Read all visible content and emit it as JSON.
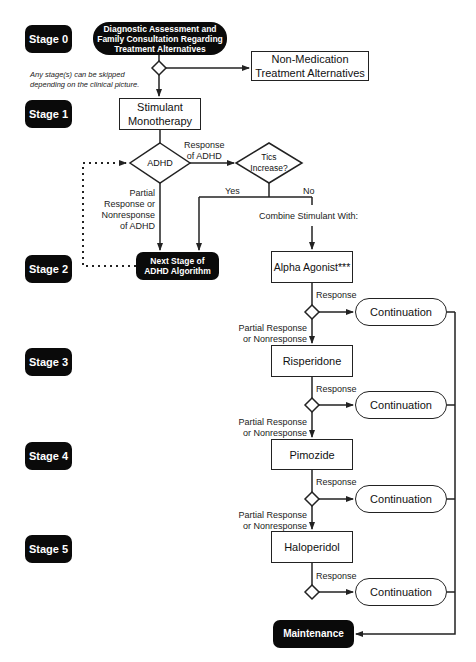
{
  "stages": [
    "Stage 0",
    "Stage 1",
    "Stage 2",
    "Stage 3",
    "Stage 4",
    "Stage 5"
  ],
  "note": {
    "line1": "Any stage(s) can be skipped",
    "line2": "depending on the clinical picture."
  },
  "nodes": {
    "diagnostic": {
      "line1": "Diagnostic Assessment and",
      "line2": "Family Consultation Regarding",
      "line3": "Treatment Alternatives"
    },
    "non_medication": {
      "line1": "Non-Medication",
      "line2": "Treatment Alternatives"
    },
    "stimulant": {
      "line1": "Stimulant",
      "line2": "Monotherapy"
    },
    "adhd_decision": "ADHD",
    "tics_decision": {
      "line1": "Tics",
      "line2": "Increase?"
    },
    "next_stage": {
      "line1": "Next Stage of",
      "line2": "ADHD Algorithm"
    },
    "alpha_agonist": "Alpha Agonist***",
    "risperidone": "Risperidone",
    "pimozide": "Pimozide",
    "haloperidol": "Haloperidol",
    "continuation": "Continuation",
    "maintenance": "Maintenance"
  },
  "edge_labels": {
    "response_of_adhd": {
      "line1": "Response",
      "line2": "of ADHD"
    },
    "partial_adhd": {
      "line1": "Partial",
      "line2": "Response or",
      "line3": "Nonresponse",
      "line4": "of ADHD"
    },
    "yes": "Yes",
    "no": "No",
    "combine": "Combine Stimulant With:",
    "response": "Response",
    "partial": {
      "line1": "Partial Response",
      "line2": "or Nonresponse"
    }
  },
  "colors": {
    "dark_fill": "#0a0a0a",
    "line": "#222222",
    "background": "#ffffff"
  }
}
